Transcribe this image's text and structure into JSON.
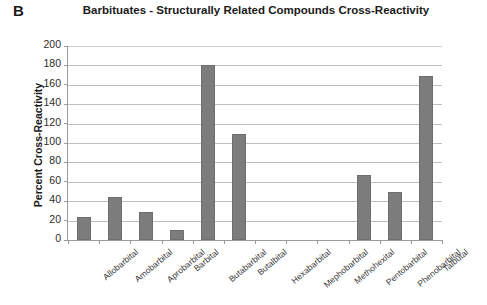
{
  "panel": {
    "letter": "B"
  },
  "chart_data": {
    "type": "bar",
    "title": "Barbituates - Structurally Related Compounds Cross-Reactivity",
    "xlabel": "",
    "ylabel": "Percent Cross-Reactivity",
    "ylim": [
      0,
      200
    ],
    "ytick_step": 20,
    "yticks": [
      200,
      180,
      160,
      140,
      120,
      100,
      80,
      60,
      40,
      20,
      0
    ],
    "grid": true,
    "legend": "none",
    "bar_color": "#7c7c7c",
    "categories": [
      "Allobarbital",
      "Amobarbital",
      "Aprobarbital",
      "Barbital",
      "Butabarbital",
      "Butalbital",
      "Hexabarbital",
      "Mephobarbital",
      "Methohexital",
      "Pentobarbital",
      "Phenobarbital",
      "Talbutal"
    ],
    "values": [
      24,
      44,
      29,
      10,
      180,
      109,
      0,
      0,
      0,
      67,
      50,
      169
    ]
  }
}
